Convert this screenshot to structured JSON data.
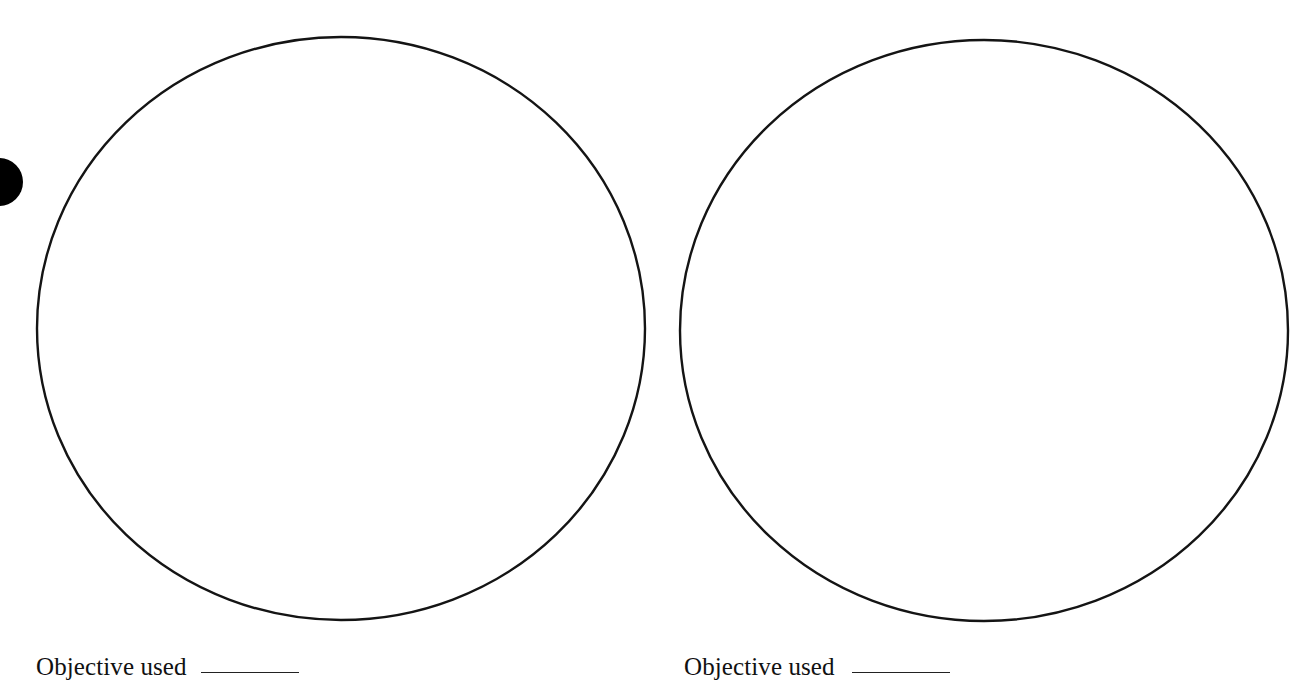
{
  "page": {
    "type": "microscope drawing worksheet",
    "background_color": "#ffffff",
    "ink_color": "#111111"
  },
  "hole_punch": {
    "icon": "binder-hole-punch",
    "color": "#000000"
  },
  "fields_of_view": [
    {
      "id": "field-1",
      "shape": "circle",
      "content": "",
      "caption": {
        "label": "Objective used",
        "value": ""
      }
    },
    {
      "id": "field-2",
      "shape": "circle",
      "content": "",
      "caption": {
        "label": "Objective used",
        "value": ""
      }
    }
  ]
}
